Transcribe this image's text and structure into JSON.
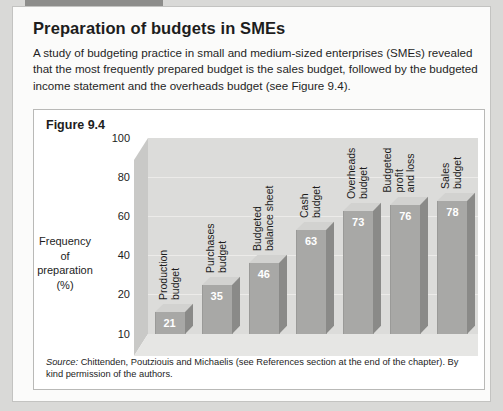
{
  "document": {
    "title": "Preparation of budgets in SMEs",
    "body": "A study of budgeting practice in small and medium-sized enterprises (SMEs) revealed that the most frequently prepared budget is the sales budget, followed by the budgeted income statement and the overheads budget (see Figure 9.4).",
    "figure_label": "Figure 9.4",
    "source_prefix": "Source:",
    "source_text": " Chittenden, Poutziouis and Michaelis (see References section at the end of the chapter). By kind permission of the authors."
  },
  "chart_data": {
    "type": "bar",
    "title": "Figure 9.4",
    "xlabel": "",
    "ylabel": "Frequency of preparation (%)",
    "ylabel_lines": [
      "Frequency",
      "of",
      "preparation",
      "(%)"
    ],
    "categories": [
      "Production budget",
      "Purchases budget",
      "Budgeted balance sheet",
      "Cash budget",
      "Overheads budget",
      "Budgeted profit and loss",
      "Sales budget"
    ],
    "category_lines": [
      [
        "Production",
        "budget"
      ],
      [
        "Purchases",
        "budget"
      ],
      [
        "Budgeted",
        "balance sheet"
      ],
      [
        "Cash",
        "budget"
      ],
      [
        "Overheads",
        "budget"
      ],
      [
        "Budgeted",
        "profit",
        "and loss"
      ],
      [
        "Sales",
        "budget"
      ]
    ],
    "values": [
      21,
      35,
      46,
      63,
      73,
      76,
      78
    ],
    "yticks": [
      100,
      80,
      60,
      40,
      20,
      10
    ],
    "ylim": [
      10,
      110
    ],
    "grid": true,
    "legend": false,
    "colors": {
      "bar_front": "#a8a8a6",
      "bar_top": "#d2d2d0",
      "bar_side": "#8a8a88",
      "wall_back": "#dcdcda",
      "wall_side": "#c9c9c7",
      "floor": "#e6e6e4",
      "value_label": "#ffffff"
    }
  }
}
